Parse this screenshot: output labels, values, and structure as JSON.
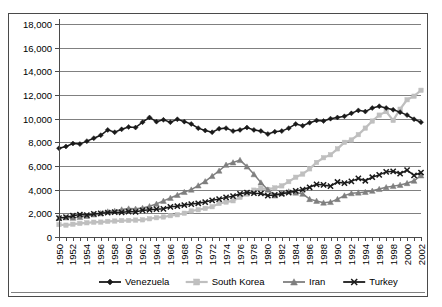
{
  "chart_data": {
    "type": "line",
    "title": "",
    "subtitle": "",
    "xlabel": "",
    "ylabel": "",
    "ylim": [
      0,
      18000
    ],
    "ytick_labels": [
      "0",
      "2,000",
      "4,000",
      "6,000",
      "8,000",
      "10,000",
      "12,000",
      "14,000",
      "16,000",
      "18,000"
    ],
    "ytick_values": [
      0,
      2000,
      4000,
      6000,
      8000,
      10000,
      12000,
      14000,
      16000,
      18000
    ],
    "grid": true,
    "legend_position": "bottom",
    "x": [
      1950,
      1951,
      1952,
      1953,
      1954,
      1955,
      1956,
      1957,
      1958,
      1959,
      1960,
      1961,
      1962,
      1963,
      1964,
      1965,
      1966,
      1967,
      1968,
      1969,
      1970,
      1971,
      1972,
      1973,
      1974,
      1975,
      1976,
      1977,
      1978,
      1979,
      1980,
      1981,
      1982,
      1983,
      1984,
      1985,
      1986,
      1987,
      1988,
      1989,
      1990,
      1991,
      1992,
      1993,
      1994,
      1995,
      1996,
      1997,
      1998,
      1999,
      2000,
      2001,
      2002
    ],
    "xtick_labels": [
      "1950",
      "1952",
      "1954",
      "1956",
      "1958",
      "1960",
      "1962",
      "1964",
      "1966",
      "1968",
      "1970",
      "1972",
      "1974",
      "1976",
      "1978",
      "1980",
      "1982",
      "1984",
      "1986",
      "1988",
      "1990",
      "1992",
      "1994",
      "1996",
      "1998",
      "2000",
      "2002"
    ],
    "series": [
      {
        "name": "Venezuela",
        "color": "#1a1a1a",
        "marker": "diamond",
        "values": [
          7500,
          7650,
          7900,
          7850,
          8100,
          8350,
          8600,
          9050,
          8850,
          9100,
          9300,
          9250,
          9700,
          10100,
          9750,
          9900,
          9700,
          9950,
          9750,
          9550,
          9200,
          9000,
          8850,
          9150,
          9200,
          8950,
          9050,
          9250,
          9050,
          8950,
          8700,
          8900,
          8950,
          9200,
          9550,
          9400,
          9650,
          9850,
          9800,
          10000,
          10100,
          10200,
          10450,
          10700,
          10600,
          10900,
          11050,
          10900,
          10750,
          10550,
          10300,
          9950,
          9700
        ]
      },
      {
        "name": "South Korea",
        "color": "#bfbfbf",
        "marker": "square",
        "values": [
          1050,
          1000,
          1080,
          1150,
          1200,
          1250,
          1260,
          1320,
          1350,
          1390,
          1400,
          1430,
          1450,
          1540,
          1630,
          1690,
          1800,
          1880,
          2010,
          2200,
          2300,
          2420,
          2560,
          2830,
          2950,
          3060,
          3350,
          3630,
          3960,
          4120,
          4020,
          4150,
          4320,
          4680,
          5050,
          5320,
          5760,
          6300,
          6700,
          6950,
          7450,
          8000,
          8200,
          8650,
          9200,
          9800,
          10300,
          10600,
          9850,
          10800,
          11600,
          11900,
          12400
        ]
      },
      {
        "name": "Iran",
        "color": "#7f7f7f",
        "marker": "triangle",
        "values": [
          1600,
          1650,
          1620,
          1680,
          1780,
          1900,
          2000,
          2150,
          2200,
          2320,
          2400,
          2380,
          2450,
          2600,
          2800,
          3050,
          3300,
          3550,
          3800,
          4000,
          4350,
          4700,
          5150,
          5600,
          6100,
          6300,
          6500,
          5950,
          5300,
          4600,
          4000,
          3500,
          3700,
          3850,
          3750,
          3650,
          3200,
          3050,
          2900,
          2950,
          3200,
          3500,
          3700,
          3750,
          3800,
          3900,
          4050,
          4200,
          4300,
          4400,
          4550,
          4750,
          5200
        ]
      },
      {
        "name": "Turkey",
        "color": "#1a1a1a",
        "marker": "x",
        "values": [
          1600,
          1680,
          1800,
          1900,
          1850,
          1950,
          2000,
          2050,
          2100,
          2080,
          2150,
          2120,
          2250,
          2300,
          2350,
          2380,
          2550,
          2600,
          2700,
          2780,
          2850,
          2950,
          3100,
          3200,
          3350,
          3450,
          3650,
          3750,
          3700,
          3680,
          3500,
          3550,
          3650,
          3750,
          3900,
          4000,
          4200,
          4450,
          4400,
          4300,
          4650,
          4550,
          4700,
          4950,
          4750,
          5050,
          5250,
          5500,
          5550,
          5350,
          5650,
          5200,
          5450
        ]
      }
    ]
  },
  "legend": {
    "items": [
      {
        "label": "Venezuela"
      },
      {
        "label": "South Korea"
      },
      {
        "label": "Iran"
      },
      {
        "label": "Turkey"
      }
    ]
  }
}
